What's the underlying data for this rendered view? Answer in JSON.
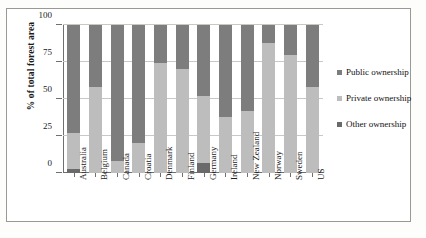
{
  "chart_data": {
    "type": "bar",
    "title": "",
    "subtitle": "",
    "xlabel": "",
    "ylabel": "% of total forest area",
    "ylim": [
      0,
      100
    ],
    "yticks": [
      0,
      25,
      50,
      75,
      100
    ],
    "ytick_labels": [
      "0",
      "25",
      "50",
      "75",
      "100"
    ],
    "grid": true,
    "stacked": true,
    "stack_total": 100,
    "legend_position": "right",
    "categories": [
      "Australia",
      "Belgium",
      "Canada",
      "Croatia",
      "Denmark",
      "Finland",
      "Germany",
      "Ireland",
      "New Zealand",
      "Norway",
      "Sweden",
      "US"
    ],
    "series": [
      {
        "name": "Public ownership",
        "color": "#7d7d7d",
        "values": [
          73,
          42,
          92,
          80,
          26,
          30,
          48,
          62,
          58,
          12,
          20,
          42
        ]
      },
      {
        "name": "Private ownership",
        "color": "#bdbdbd",
        "values": [
          24,
          58,
          8,
          20,
          74,
          70,
          45,
          38,
          42,
          88,
          80,
          58
        ]
      },
      {
        "name": "Other ownership",
        "color": "#6a6a6a",
        "values": [
          3,
          0,
          0,
          0,
          0,
          0,
          7,
          0,
          0,
          0,
          0,
          0
        ]
      }
    ]
  },
  "legend": {
    "items": [
      {
        "label": "Public ownership",
        "color": "#7d7d7d"
      },
      {
        "label": "Private ownership",
        "color": "#bdbdbd"
      },
      {
        "label": "Other ownership",
        "color": "#6a6a6a"
      }
    ]
  }
}
